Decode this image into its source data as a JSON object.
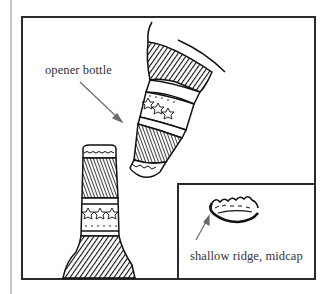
{
  "figure": {
    "labels": {
      "opener_bottle": "opener bottle",
      "inset_caption": "shallow ridge, midcap"
    },
    "elements": [
      {
        "name": "upper-bottle",
        "role": "opener bottle, tilted, neck pointing down-left"
      },
      {
        "name": "lower-bottle",
        "role": "upright bottle with crown cap"
      },
      {
        "name": "inset-bottle-cap",
        "role": "close-up of crown cap"
      }
    ],
    "colors": {
      "ink": "#1a1a1a",
      "arrow": "#6a6a6a",
      "frame": "#2a2a2a",
      "side_bar": "#c4c4c4",
      "background": "#ffffff"
    }
  }
}
